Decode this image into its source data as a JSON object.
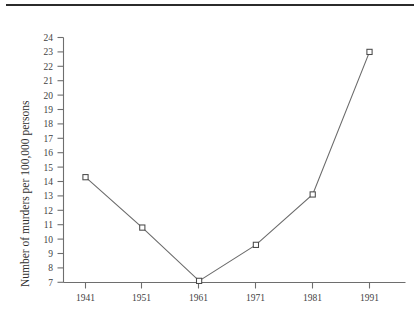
{
  "chart_data": {
    "type": "line",
    "title": "",
    "xlabel": "",
    "ylabel": "Number of murders per 100,000 persons",
    "categories": [
      "1941",
      "1951",
      "1961",
      "1971",
      "1981",
      "1991"
    ],
    "x": [
      1941,
      1951,
      1961,
      1971,
      1981,
      1991
    ],
    "values": [
      14.3,
      10.8,
      7.1,
      9.6,
      13.1,
      23.0
    ],
    "series": [
      {
        "name": "Number of murders per 100,000 persons",
        "values": [
          14.3,
          10.8,
          7.1,
          9.6,
          13.1,
          23.0
        ]
      }
    ],
    "ylim": [
      7,
      24
    ],
    "xlim": [
      1941,
      1991
    ],
    "ytick_labels": [
      "7",
      "8",
      "9",
      "10",
      "11",
      "12",
      "13",
      "14",
      "15",
      "16",
      "17",
      "18",
      "19",
      "20",
      "21",
      "22",
      "23",
      "24"
    ],
    "ytick_values": [
      7,
      8,
      9,
      10,
      11,
      12,
      13,
      14,
      15,
      16,
      17,
      18,
      19,
      20,
      21,
      22,
      23,
      24
    ],
    "xtick_labels": [
      "1941",
      "1951",
      "1961",
      "1971",
      "1981",
      "1991"
    ],
    "grid": false,
    "legend": false,
    "legend_position": "none",
    "marker": "open-square",
    "line_color": "#6b6b6b",
    "marker_fill": "#ffffff",
    "marker_edge": "#4a4a4a",
    "axis_color": "#6e6e6e"
  },
  "figure": {
    "background": "#ffffff",
    "top_rule_color": "#2b2b2b"
  }
}
